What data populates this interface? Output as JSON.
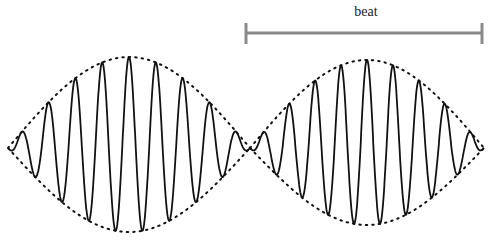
{
  "figure": {
    "type": "beat-waveform-diagram",
    "annotation": {
      "label": "beat",
      "bar_color": "#8a8a8a",
      "bar_x_start": 246,
      "bar_x_end": 482,
      "bar_y": 33,
      "tick_top": 23,
      "tick_bottom": 44
    },
    "waveform": {
      "color": "#111111",
      "x_start": 8,
      "x_node": 250,
      "x_end": 484,
      "center_y": 148,
      "left_lobe": {
        "amplitude_top": 91,
        "amplitude_bottom": 84,
        "cycles": 9
      },
      "right_lobe": {
        "amplitude_top": 88,
        "amplitude_bottom": 77,
        "cycles": 9
      }
    },
    "envelope": {
      "style": "dotted",
      "color": "#111111"
    }
  }
}
